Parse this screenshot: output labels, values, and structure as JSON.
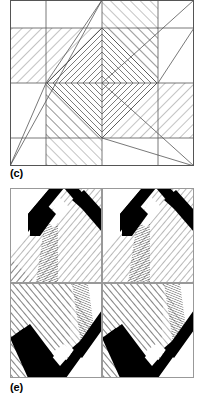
{
  "figure": {
    "background": "#ffffff",
    "line_color": "#000000",
    "fill_black": "#000000",
    "panels": [
      {
        "id": "c",
        "label": "(c)",
        "x": 10,
        "y": 0,
        "width": 184,
        "height": 166,
        "description": "Square tiling with nested concentric diamonds at centre and diagonal hatched bands in each quadrant",
        "border": true
      },
      {
        "id": "e",
        "label": "(e)",
        "x": 10,
        "y": 188,
        "width": 184,
        "height": 190,
        "description": "Two-by-two array of chevron motifs with heavy black bands and diagonal hatching",
        "border": true
      }
    ]
  },
  "panel_c": {
    "label": "(c)",
    "grid": {
      "cols": [
        0,
        36,
        92,
        148,
        184
      ],
      "rows": [
        0,
        28,
        83,
        138,
        166
      ]
    },
    "center": {
      "x": 92,
      "y": 83
    },
    "diamond_rings": [
      9,
      19,
      29,
      39,
      49
    ],
    "hatch_regions": [
      {
        "name": "upper-left-band",
        "angle": -45,
        "spacing": 5
      },
      {
        "name": "upper-right-band",
        "angle": 45,
        "spacing": 5
      },
      {
        "name": "lower-left-band",
        "angle": 45,
        "spacing": 5
      },
      {
        "name": "lower-right-band",
        "angle": -45,
        "spacing": 5
      },
      {
        "name": "center-diamond-rings",
        "angle": 0,
        "spacing": 5
      }
    ],
    "diagonals": [
      {
        "name": "lower-left-diagonal",
        "from": [
          0,
          166
        ],
        "to": [
          92,
          0
        ]
      },
      {
        "name": "upper-right-diagonal",
        "from": [
          184,
          0
        ],
        "to": [
          92,
          83
        ]
      },
      {
        "name": "lower-right-diagonal",
        "from": [
          184,
          166
        ],
        "to": [
          92,
          83
        ]
      }
    ]
  },
  "panel_e": {
    "label": "(e)",
    "grid": {
      "cols": [
        0,
        92,
        184
      ],
      "rows": [
        0,
        95,
        190
      ]
    },
    "cells": [
      {
        "name": "cell-top-left",
        "orientation": "chevron-up",
        "black_bands": 2,
        "hatch_angle": 40
      },
      {
        "name": "cell-top-right",
        "orientation": "chevron-up",
        "black_bands": 2,
        "hatch_angle": 40
      },
      {
        "name": "cell-bottom-left",
        "orientation": "chevron-down",
        "black_bands": 2,
        "hatch_angle": -40
      },
      {
        "name": "cell-bottom-right",
        "orientation": "chevron-down",
        "black_bands": 2,
        "hatch_angle": -40
      }
    ],
    "band_width": 9,
    "hatch_spacing": 4
  }
}
